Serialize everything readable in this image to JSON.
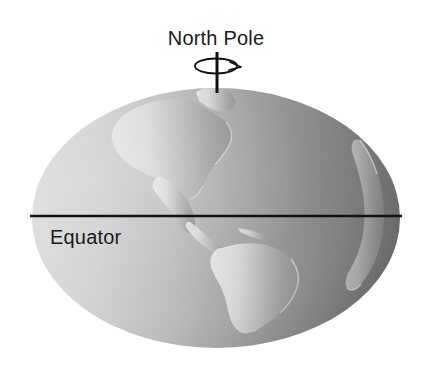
{
  "figure": {
    "type": "earth-globe-diagram",
    "background_color": "#ffffff",
    "labels": {
      "north_pole": "North Pole",
      "equator": "Equator"
    },
    "globe": {
      "shape": "ellipse",
      "center_x": 216,
      "center_y": 218,
      "radius_x": 184,
      "radius_y": 130,
      "ocean_gradient_light": "#dadada",
      "ocean_gradient_mid": "#a8a8a8",
      "ocean_gradient_dark": "#6b6b6b",
      "land_color_light": "#e2e2e2",
      "land_color_dark": "#8e8e8e",
      "coastline_color": "#cfcfcf"
    },
    "equator_line": {
      "y": 216,
      "x_start": 30,
      "x_end": 402,
      "color": "#111111",
      "thickness": 2.4
    },
    "axis": {
      "x": 217,
      "y_top": 52,
      "y_bottom": 93,
      "color": "#111111",
      "thickness": 3
    },
    "rotation_indicator": {
      "icon": "rotation-arrow-icon",
      "center_x": 216,
      "center_y": 66,
      "radius_x": 21,
      "radius_y": 7,
      "color": "#111111",
      "arrow_direction": "right"
    },
    "continents": [
      {
        "name": "north-america"
      },
      {
        "name": "central-america"
      },
      {
        "name": "south-america"
      },
      {
        "name": "west-africa-coast"
      },
      {
        "name": "greenland"
      }
    ]
  }
}
